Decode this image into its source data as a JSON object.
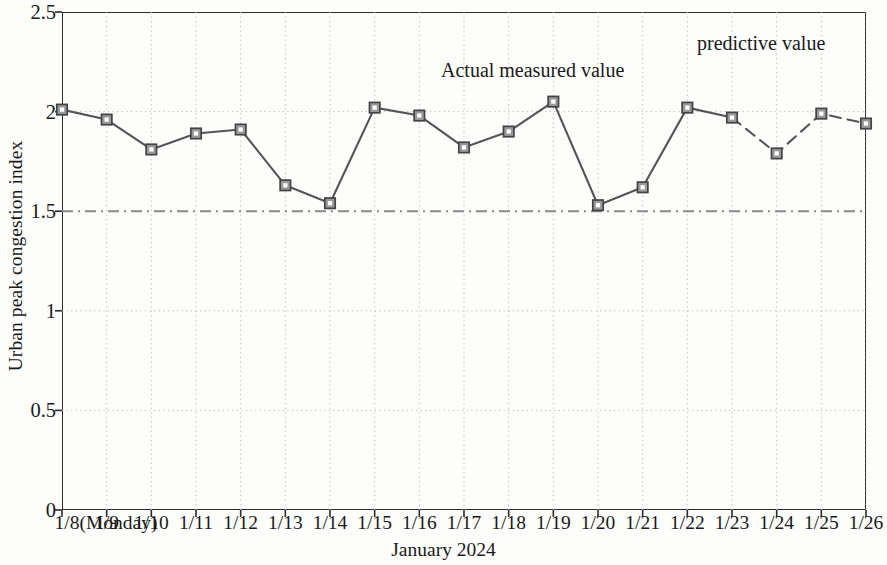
{
  "chart_data": {
    "type": "line",
    "title": "",
    "xlabel": "January 2024",
    "ylabel": "Urban peak congestion index",
    "ylim": [
      0,
      2.5
    ],
    "ytick_labels": [
      "0",
      "0.5",
      "1",
      "1.5",
      "2",
      "2.5"
    ],
    "ytick_values": [
      0,
      0.5,
      1,
      1.5,
      2,
      2.5
    ],
    "grid": true,
    "legend_position": "in-plot annotations",
    "categories": [
      "1/8(Monday)",
      "1/9",
      "1/10",
      "1/11",
      "1/12",
      "1/13",
      "1/14",
      "1/15",
      "1/16",
      "1/17",
      "1/18",
      "1/19",
      "1/20",
      "1/21",
      "1/22",
      "1/23",
      "1/24",
      "1/25",
      "1/26"
    ],
    "x": [
      0,
      1,
      2,
      3,
      4,
      5,
      6,
      7,
      8,
      9,
      10,
      11,
      12,
      13,
      14,
      15,
      16,
      17,
      18
    ],
    "series": [
      {
        "name": "Actual measured value",
        "style": "solid",
        "marker": "square",
        "x": [
          0,
          1,
          2,
          3,
          4,
          5,
          6,
          7,
          8,
          9,
          10,
          11,
          12,
          13,
          14,
          15
        ],
        "values": [
          2.01,
          1.96,
          1.81,
          1.89,
          1.91,
          1.63,
          1.54,
          2.02,
          1.98,
          1.82,
          1.9,
          2.05,
          1.53,
          1.62,
          2.02,
          1.97
        ]
      },
      {
        "name": "predictive value",
        "style": "dashed",
        "marker": "square",
        "x": [
          15,
          16,
          17,
          18
        ],
        "values": [
          1.97,
          1.79,
          1.99,
          1.94
        ]
      }
    ],
    "threshold_line": {
      "label": "",
      "value": 1.5,
      "style": "dash-dot",
      "color": "#8a8a8a"
    },
    "annotations": [
      {
        "text": "Actual measured value",
        "x": 7.8,
        "y": 2.26
      },
      {
        "text": "predictive value",
        "x": 14.6,
        "y": 2.38
      }
    ],
    "colors": {
      "line": "#555555",
      "marker_edge": "#444444",
      "marker_face": "#9a9a9a",
      "axis": "#2b2b2b",
      "grid": "#b9b9b9",
      "threshold": "#8a8a8a"
    }
  },
  "axes": {
    "y_title": "Urban peak congestion index",
    "x_title": "January 2024"
  },
  "annotations": {
    "actual": "Actual measured value",
    "predictive": "predictive value"
  }
}
